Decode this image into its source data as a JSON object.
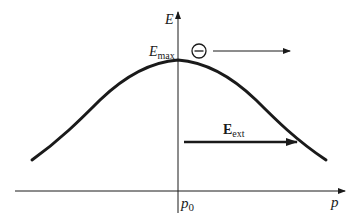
{
  "diagram": {
    "type": "energy-vs-momentum",
    "y_axis_label": "E",
    "x_axis_label": "p",
    "origin_label": {
      "base": "p",
      "sub": "0"
    },
    "peak_label": {
      "base": "E",
      "sub": "max"
    },
    "field_label": {
      "base": "E",
      "sub": "ext"
    },
    "particle": {
      "symbol": "−",
      "name": "electron",
      "charge": "negative"
    },
    "colors": {
      "stroke": "#1a1a1a",
      "background": "#ffffff"
    }
  }
}
